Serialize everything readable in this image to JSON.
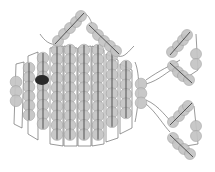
{
  "diagram": {
    "title": "Beaded fish pattern",
    "subject": "fish",
    "colors": {
      "bead": "#c4c4c4",
      "bead_outline": "#9e9e9e",
      "thread": "#6e6e6e",
      "eye": "#2a2a2a",
      "background": "#ffffff"
    },
    "body_columns": [
      {
        "x": 16,
        "y_top": 82,
        "count": 3
      },
      {
        "x": 29,
        "y_top": 68,
        "count": 6
      },
      {
        "x": 43,
        "y_top": 58,
        "count": 8
      },
      {
        "x": 57,
        "y_top": 50,
        "count": 10
      },
      {
        "x": 70,
        "y_top": 50,
        "count": 10
      },
      {
        "x": 84,
        "y_top": 50,
        "count": 10
      },
      {
        "x": 98,
        "y_top": 50,
        "count": 10
      },
      {
        "x": 112,
        "y_top": 56,
        "count": 8
      },
      {
        "x": 126,
        "y_top": 66,
        "count": 6
      },
      {
        "x": 141,
        "y_top": 84,
        "count": 3
      }
    ],
    "eye": {
      "x": 42,
      "y": 80,
      "rx": 7,
      "ry": 5
    },
    "dorsal_fin": {
      "left_arm_beads": 5,
      "right_arm_beads": 5
    },
    "tail_fins": [
      {
        "name": "upper",
        "diagonal_beads_a": 4,
        "diagonal_beads_b": 4,
        "pair_beads": 2
      },
      {
        "name": "lower",
        "diagonal_beads_a": 4,
        "diagonal_beads_b": 4,
        "pair_beads": 2
      }
    ]
  }
}
